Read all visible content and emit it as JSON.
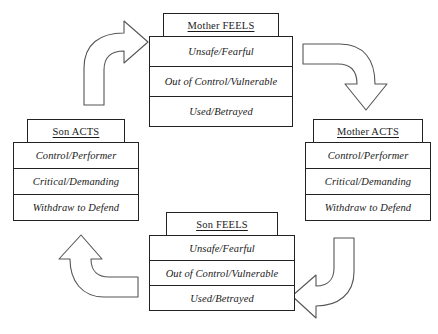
{
  "diagram": {
    "background_color": "#ffffff",
    "line_color": "#222222",
    "groups": [
      {
        "id": "mother-feels",
        "header": "Mother FEELS",
        "rows": [
          "Unsafe/Fearful",
          "Out of Control/Vulnerable",
          "Used/Betrayed"
        ]
      },
      {
        "id": "mother-acts",
        "header": "Mother ACTS",
        "rows": [
          "Control/Performer",
          "Critical/Demanding",
          "Withdraw to Defend"
        ]
      },
      {
        "id": "son-acts",
        "header": "Son ACTS",
        "rows": [
          "Control/Performer",
          "Critical/Demanding",
          "Withdraw to Defend"
        ]
      },
      {
        "id": "son-feels",
        "header": "Son FEELS",
        "rows": [
          "Unsafe/Fearful",
          "Out of Control/Vulnerable",
          "Used/Betrayed"
        ]
      }
    ],
    "arrows": [
      {
        "id": "arrow-son-acts-to-mother-feels",
        "direction": "up-then-right",
        "from": "Son ACTS",
        "to": "Mother FEELS"
      },
      {
        "id": "arrow-mother-feels-to-mother-acts",
        "direction": "right-then-down",
        "from": "Mother FEELS",
        "to": "Mother ACTS"
      },
      {
        "id": "arrow-mother-acts-to-son-feels",
        "direction": "down-then-left",
        "from": "Mother ACTS",
        "to": "Son FEELS"
      },
      {
        "id": "arrow-son-feels-to-son-acts",
        "direction": "left-then-up",
        "from": "Son FEELS",
        "to": "Son ACTS"
      }
    ]
  }
}
